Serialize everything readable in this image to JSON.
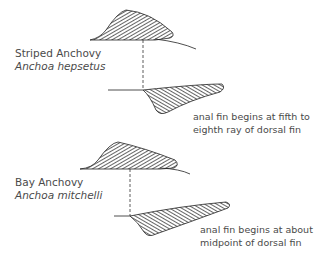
{
  "diagram": {
    "panels": [
      {
        "common_name": "Striped Anchovy",
        "scientific_name": "Anchoa hepsetus",
        "note_line1": "anal fin begins at fifth to",
        "note_line2": "eighth ray of dorsal fin"
      },
      {
        "common_name": "Bay Anchovy",
        "scientific_name": "Anchoa mitchelli",
        "note_line1": "anal fin begins at about",
        "note_line2": "midpoint of dorsal fin"
      }
    ],
    "colors": {
      "ink": "#222222",
      "text": "#4a4a4a",
      "background": "#ffffff"
    }
  }
}
